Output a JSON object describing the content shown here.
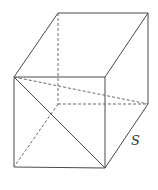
{
  "figure": {
    "type": "cube-with-diagonals",
    "edge_label": "S",
    "colors": {
      "line": "#4a4a4a",
      "hidden_line": "#6a6a6a",
      "label": "#333333",
      "background": "#ffffff"
    },
    "vertices": {
      "front_top_left": [
        14,
        77
      ],
      "front_top_right": [
        105,
        77
      ],
      "front_bottom_left": [
        14,
        167
      ],
      "front_bottom_right": [
        105,
        168
      ],
      "back_top_left": [
        58,
        13
      ],
      "back_top_right": [
        148,
        13
      ],
      "back_bottom_left": [
        58,
        104
      ],
      "back_bottom_right": [
        148,
        104
      ]
    },
    "visible_edges": [
      [
        "front_top_left",
        "front_top_right"
      ],
      [
        "front_top_right",
        "front_bottom_right"
      ],
      [
        "front_bottom_right",
        "front_bottom_left"
      ],
      [
        "front_bottom_left",
        "front_top_left"
      ],
      [
        "front_top_left",
        "back_top_left"
      ],
      [
        "back_top_left",
        "back_top_right"
      ],
      [
        "back_top_right",
        "front_top_right"
      ],
      [
        "back_top_right",
        "back_bottom_right"
      ],
      [
        "back_bottom_right",
        "front_bottom_right"
      ]
    ],
    "hidden_edges": [
      [
        "back_top_left",
        "back_bottom_left"
      ],
      [
        "back_bottom_left",
        "back_bottom_right"
      ],
      [
        "back_bottom_left",
        "front_bottom_left"
      ]
    ],
    "diagonals": [
      {
        "from": "front_top_left",
        "to": "front_bottom_right",
        "style": "solid"
      },
      {
        "from": "front_top_left",
        "to": "back_bottom_right",
        "style": "dashed"
      }
    ],
    "label_position": [
      131,
      145
    ]
  }
}
